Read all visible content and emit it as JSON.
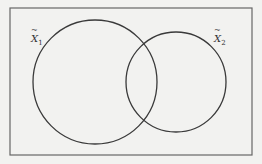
{
  "diagram": {
    "type": "venn",
    "sets": [
      {
        "name": "X1",
        "label_base": "X",
        "label_sub": "1",
        "accent": "~"
      },
      {
        "name": "X2",
        "label_base": "X",
        "label_sub": "2",
        "accent": "~"
      }
    ],
    "colors": {
      "stroke": "#3a3a3a",
      "background": "#f2f2f0",
      "border": "#555555"
    }
  }
}
